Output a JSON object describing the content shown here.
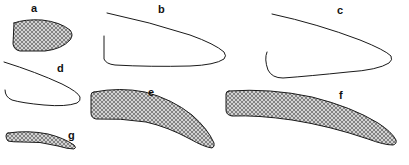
{
  "figure": {
    "type": "specimen-outline-plate",
    "background_color": "#ffffff",
    "stroke_color": "#1a1a1a",
    "hatch_color": "#555555",
    "hatch_fill_color": "#bdbdbd",
    "panel_count": 7
  },
  "panels": [
    {
      "id": "a",
      "label": "a",
      "label_x": 31,
      "label_y": 12,
      "style": "hatched",
      "description": "small hatched wedge, blunt left edge tapering to rounded point at right",
      "path": "M 14 23 L 13 44 Q 14 50 20 51 L 45 51 Q 62 49 70 40 Q 74 35 70 30 Q 60 22 42 20 Q 25 19 14 23 Z"
    },
    {
      "id": "b",
      "label": "b",
      "label_x": 158,
      "label_y": 13,
      "style": "outline",
      "description": "large open outline, upper curve from left sweeping right to a tapered point, lower curve with notch at left",
      "path": "M 107 13 Q 150 22 190 35 Q 215 44 224 52 Q 227 56 224 59 Q 215 65 190 66 Q 150 67 115 65 Q 106 64 104 59 L 104 36"
    },
    {
      "id": "c",
      "label": "c",
      "label_x": 337,
      "label_y": 14,
      "style": "outline",
      "description": "large open outline mirroring b, upper curve sweeping right to tapered point, lower curve with hooked notch at left",
      "path": "M 272 14 Q 318 24 360 40 Q 385 50 391 56 Q 393 60 389 63 Q 378 70 348 72 Q 310 76 283 78 Q 272 78 268 70 Q 264 59 267 52"
    },
    {
      "id": "d",
      "label": "d",
      "label_x": 57,
      "label_y": 72,
      "style": "outline",
      "description": "small open outline, upper curve to tapered right point, lower curve hooking back at left",
      "path": "M 4 62 Q 36 72 62 84 Q 78 92 80 97 Q 81 101 77 103 Q 66 107 44 105 Q 22 103 12 100 Q 5 97 5 90"
    },
    {
      "id": "e",
      "label": "e",
      "label_x": 148,
      "label_y": 96,
      "style": "hatched",
      "description": "hatched curved claw, broad truncated left base curving down and right to a sharp tip",
      "path": "M 94 92 Q 120 87 145 92 Q 172 99 192 115 Q 208 129 214 143 Q 215 147 212 148 Q 204 147 190 139 Q 168 127 146 122 Q 120 118 96 119 Q 91 118 91 113 L 91 95 Q 91 92 94 92 Z"
    },
    {
      "id": "f",
      "label": "f",
      "label_x": 339,
      "label_y": 99,
      "style": "hatched",
      "description": "large hatched elongated claw, truncated left base extending right to a long narrow tip",
      "path": "M 229 91 Q 270 88 312 97 Q 352 107 378 123 Q 392 132 396 140 Q 397 144 393 145 Q 384 145 368 139 Q 330 126 292 120 Q 258 115 232 116 Q 226 115 226 110 L 226 94 Q 226 91 229 91 Z"
    },
    {
      "id": "g",
      "label": "g",
      "label_x": 68,
      "label_y": 139,
      "style": "hatched",
      "description": "small thin hatched wedge, broad left end tapering to a slender right tip",
      "path": "M 8 133 Q 28 130 48 134 Q 64 138 74 145 Q 77 148 74 149 Q 68 149 58 146 Q 40 141 22 142 Q 12 142 8 141 Q 6 139 6 136 Q 6 133 8 133 Z"
    }
  ]
}
